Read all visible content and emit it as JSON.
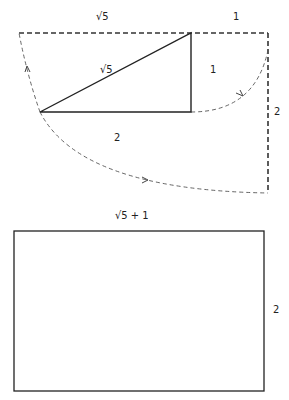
{
  "diagram": {
    "top_figure": {
      "labels": {
        "top_left": "√5",
        "top_right": "1",
        "hypotenuse": "√5",
        "vertical_leg": "1",
        "base": "2",
        "right_side": "2"
      }
    },
    "bottom_figure": {
      "labels": {
        "width": "√5 + 1",
        "height": "2"
      }
    },
    "colors": {
      "line": "#222222",
      "dashed": "#333333"
    }
  }
}
